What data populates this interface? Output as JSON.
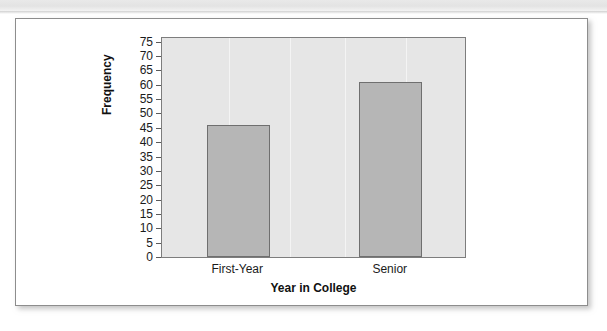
{
  "chart_data": {
    "type": "bar",
    "title": "",
    "xlabel": "Year in College",
    "ylabel": "Frequency",
    "categories": [
      "First-Year",
      "Senior"
    ],
    "values": [
      46,
      61
    ],
    "ylim": [
      0,
      77
    ],
    "ytick_step": 5,
    "yticks": [
      0,
      5,
      10,
      15,
      20,
      25,
      30,
      35,
      40,
      45,
      50,
      55,
      60,
      65,
      70,
      75
    ],
    "ytick_labels": [
      "0",
      "5",
      "10",
      "15",
      "20",
      "25",
      "30",
      "35",
      "40",
      "45",
      "50",
      "55",
      "60",
      "65",
      "70",
      "75"
    ],
    "grid": "vertical-light",
    "legend": null,
    "series": [
      {
        "name": "Frequency",
        "values": [
          46,
          61
        ]
      }
    ],
    "colors": {
      "bar_fill": "#b6b6b6",
      "bar_border": "#6f6f6f",
      "plot_background": "#e6e6e6",
      "plot_border": "#7d7d7d",
      "axis_text": "#1b1b1b",
      "figure_background": "#ffffff",
      "figure_border": "#8d8d8d"
    }
  }
}
